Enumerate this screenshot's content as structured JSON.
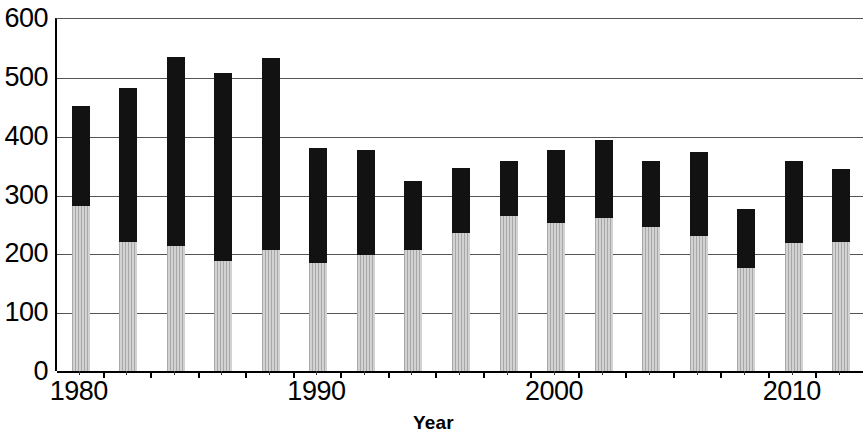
{
  "chart_data": {
    "type": "bar",
    "stacked": true,
    "title": "",
    "subtitle": "",
    "xlabel": "Year",
    "ylabel": "",
    "xlim": [
      1979,
      2013
    ],
    "ylim": [
      0,
      600
    ],
    "ytick_labels": [
      "600",
      "500",
      "400",
      "300",
      "200",
      "100",
      "0"
    ],
    "ytick_values": [
      600,
      500,
      400,
      300,
      200,
      100,
      0
    ],
    "xtick_labels": [
      "1980",
      "1990",
      "2000",
      "2010"
    ],
    "xtick_values": [
      1980,
      1990,
      2000,
      2010
    ],
    "grid": true,
    "legend": "none",
    "categories": [
      1980,
      1982,
      1984,
      1986,
      1988,
      1990,
      1992,
      1994,
      1996,
      1998,
      2000,
      2002,
      2004,
      2006,
      2008,
      2010,
      2012
    ],
    "series": [
      {
        "name": "lower-segment",
        "color": "#b9b9b9",
        "fill": "hatched-gray",
        "values": [
          280,
          220,
          212,
          187,
          205,
          183,
          198,
          205,
          234,
          263,
          252,
          260,
          245,
          230,
          175,
          217,
          220
        ]
      },
      {
        "name": "upper-segment",
        "color": "#121212",
        "fill": "solid-black",
        "values": [
          170,
          261,
          322,
          320,
          327,
          196,
          177,
          118,
          111,
          94,
          124,
          133,
          112,
          143,
          100,
          140,
          124
        ]
      }
    ],
    "totals": [
      450,
      481,
      534,
      507,
      532,
      379,
      375,
      323,
      345,
      357,
      376,
      393,
      357,
      373,
      275,
      357,
      344
    ],
    "bar_width_years": 0.75
  }
}
